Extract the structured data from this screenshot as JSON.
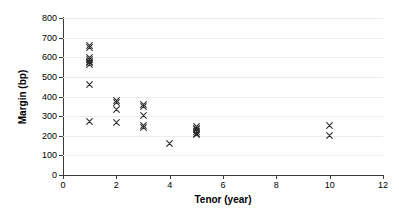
{
  "chart_data": {
    "type": "scatter",
    "title": "",
    "xlabel": "Tenor (year)",
    "ylabel": "Margin (bp)",
    "xlim": [
      0,
      12
    ],
    "ylim": [
      0,
      800
    ],
    "xticks": [
      0,
      2,
      4,
      6,
      8,
      10,
      12
    ],
    "yticks": [
      0,
      100,
      200,
      300,
      400,
      500,
      600,
      700,
      800
    ],
    "grid": true,
    "legend": "none",
    "marker_symbol": "x",
    "marker_color": "#2b2b2b",
    "series": [
      {
        "name": "Loan margins",
        "points": [
          {
            "x": 1,
            "y": 660
          },
          {
            "x": 1,
            "y": 650
          },
          {
            "x": 1,
            "y": 600
          },
          {
            "x": 1,
            "y": 590
          },
          {
            "x": 1,
            "y": 580
          },
          {
            "x": 1,
            "y": 575
          },
          {
            "x": 1,
            "y": 565
          },
          {
            "x": 1,
            "y": 460
          },
          {
            "x": 1,
            "y": 275
          },
          {
            "x": 2,
            "y": 380
          },
          {
            "x": 2,
            "y": 370
          },
          {
            "x": 2,
            "y": 335
          },
          {
            "x": 2,
            "y": 270
          },
          {
            "x": 3,
            "y": 360
          },
          {
            "x": 3,
            "y": 350
          },
          {
            "x": 3,
            "y": 305
          },
          {
            "x": 3,
            "y": 250
          },
          {
            "x": 3,
            "y": 240
          },
          {
            "x": 4,
            "y": 160
          },
          {
            "x": 5,
            "y": 245
          },
          {
            "x": 5,
            "y": 238
          },
          {
            "x": 5,
            "y": 230
          },
          {
            "x": 5,
            "y": 222
          },
          {
            "x": 5,
            "y": 212
          },
          {
            "x": 5,
            "y": 205
          },
          {
            "x": 10,
            "y": 252
          },
          {
            "x": 10,
            "y": 203
          }
        ]
      }
    ]
  },
  "axes": {
    "y_tick_labels": [
      "0",
      "100",
      "200",
      "300",
      "400",
      "500",
      "600",
      "700",
      "800"
    ],
    "x_tick_labels": [
      "0",
      "2",
      "4",
      "6",
      "8",
      "10",
      "12"
    ],
    "y_title": "Margin (bp)",
    "x_title": "Tenor (year)"
  }
}
